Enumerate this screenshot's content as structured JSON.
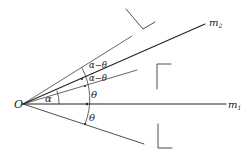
{
  "diagram": {
    "type": "geometry-optics",
    "stroke_color": "#222222",
    "labels": {
      "origin": "O",
      "mirror1": "m",
      "mirror1_sub": "1",
      "mirror2": "m",
      "mirror2_sub": "2",
      "alpha": "α",
      "alpha_minus_theta_upper": "α−θ",
      "alpha_minus_theta_lower": "α−θ",
      "theta_upper": "θ",
      "theta_lower": "θ"
    }
  }
}
